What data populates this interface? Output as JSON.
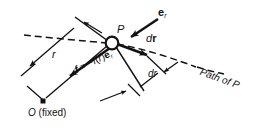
{
  "figure": {
    "type": "mechanics-vector-diagram",
    "stroke_color": "#121212",
    "background_color": "#ffffff"
  },
  "labels": {
    "point_p": "P",
    "unit_vector_e": "e",
    "unit_vector_e_sub": "r",
    "displacement_vector_d": "d",
    "displacement_vector_r": "r",
    "radial_increment": "dr",
    "radius": "r",
    "force_f": "f",
    "force_equals": "= −",
    "force_magnitude": "f",
    "force_arg_open": "(",
    "force_arg_r": "r",
    "force_arg_close": ")",
    "force_unit_e": "e",
    "force_unit_sub": "r",
    "path_label": "Path of P",
    "origin_symbol": "O",
    "origin_note": "(fixed)"
  },
  "geometry": {
    "point_P": [
      112,
      43
    ],
    "point_O": [
      43,
      101
    ],
    "point_Q": [
      146,
      55
    ],
    "radius_r_label_pos": [
      52,
      49
    ],
    "path_curve_start": [
      24,
      35
    ],
    "path_curve_end": [
      250,
      75
    ]
  }
}
